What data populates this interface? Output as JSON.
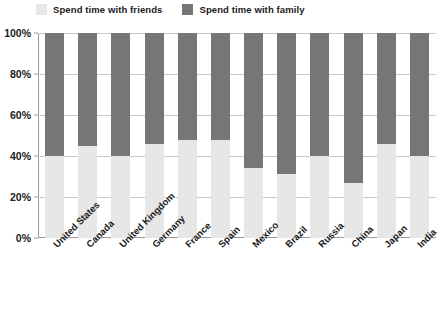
{
  "chart_data": {
    "type": "bar",
    "subtype": "stacked-100-percent",
    "title": "",
    "subtitle": "",
    "xlabel": "",
    "ylabel": "",
    "ylim": [
      0,
      100
    ],
    "yticks": [
      "0%",
      "20%",
      "40%",
      "60%",
      "80%",
      "100%"
    ],
    "ytick_values": [
      0,
      20,
      40,
      60,
      80,
      100
    ],
    "grid": true,
    "legend_position": "top-left",
    "categories": [
      "United States",
      "Canada",
      "United Kingdom",
      "Germany",
      "France",
      "Spain",
      "Mexico",
      "Brazil",
      "Russia",
      "China",
      "Japan",
      "India"
    ],
    "series": [
      {
        "name": "Spend time with friends",
        "color": "#e7e7e7",
        "values": [
          40,
          45,
          40,
          46,
          48,
          48,
          34,
          31,
          40,
          27,
          46,
          40
        ]
      },
      {
        "name": "Spend time with family",
        "color": "#767676",
        "values": [
          60,
          55,
          60,
          54,
          52,
          52,
          66,
          69,
          60,
          73,
          54,
          60
        ]
      }
    ]
  },
  "legend": {
    "items": [
      {
        "label": "Spend time with friends",
        "color": "#e7e7e7"
      },
      {
        "label": "Spend time with family",
        "color": "#767676"
      }
    ]
  },
  "colors": {
    "friends": "#e7e7e7",
    "family": "#767676",
    "gridline": "#c9c9c9",
    "axis": "#9a9a9a",
    "text": "#1b1b1b",
    "background": "#ffffff"
  }
}
